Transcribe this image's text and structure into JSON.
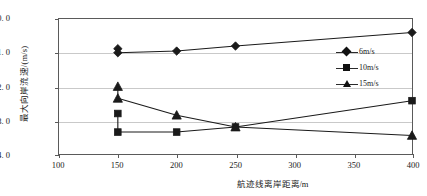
{
  "chart_data": {
    "type": "line",
    "title": "",
    "xlabel": "航迹线离岸距离/m",
    "ylabel": "最大向岸流速/(m/s)",
    "xlim": [
      100,
      400
    ],
    "ylim": [
      -4.0,
      0.0
    ],
    "xticks": [
      100,
      150,
      200,
      250,
      300,
      350,
      400
    ],
    "xtick_labels": [
      "100",
      "150",
      "200",
      "250",
      "300",
      "350",
      "400"
    ],
    "yticks": [
      0.0,
      -1.0,
      -2.0,
      -3.0,
      -4.0
    ],
    "ytick_labels": [
      "0. 0",
      "-1. 0",
      "-2. 0",
      "-3. 0",
      "-4. 0"
    ],
    "grid": "horizontal",
    "legend_position": "center-right",
    "series": [
      {
        "name": "6m/s",
        "marker": "diamond",
        "x": [
          150,
          200,
          250,
          400
        ],
        "values": [
          -1.0,
          -0.95,
          -0.8,
          -0.4
        ],
        "extra_points": [
          {
            "x": 150,
            "y": -0.88
          }
        ]
      },
      {
        "name": "10m/s",
        "marker": "square",
        "x": [
          150,
          200,
          250,
          400
        ],
        "values": [
          -3.35,
          -3.35,
          -3.2,
          -2.42
        ],
        "extra_points": [
          {
            "x": 150,
            "y": -2.8
          }
        ]
      },
      {
        "name": "15m/s",
        "marker": "triangle",
        "x": [
          150,
          200,
          250,
          400
        ],
        "values": [
          -2.35,
          -2.85,
          -3.2,
          -3.45
        ],
        "extra_points": [
          {
            "x": 150,
            "y": -2.0
          }
        ]
      }
    ]
  },
  "legend": {
    "items": [
      {
        "label": "6m/s",
        "marker": "diamond-marker"
      },
      {
        "label": "10m/s",
        "marker": "square-marker"
      },
      {
        "label": "15m/s",
        "marker": "triangle-marker"
      }
    ]
  },
  "axes": {
    "y_label": "最大向岸流速/(m/s)",
    "x_label": "航迹线离岸距离/m",
    "y_tick_0": "0. 0",
    "y_tick_1": "-1. 0",
    "y_tick_2": "-2. 0",
    "y_tick_3": "-3. 0",
    "y_tick_4": "-4. 0",
    "x_tick_0": "100",
    "x_tick_1": "150",
    "x_tick_2": "200",
    "x_tick_3": "250",
    "x_tick_4": "300",
    "x_tick_5": "350",
    "x_tick_6": "400"
  },
  "colors": {
    "series": "#1a1a1a",
    "grid": "#c9c9c9",
    "frame": "#5a5a5a",
    "background": "#ffffff"
  }
}
